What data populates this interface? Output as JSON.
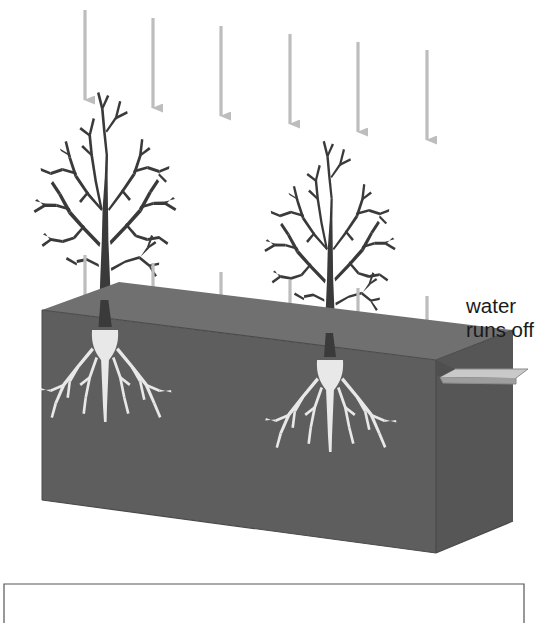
{
  "diagram": {
    "type": "cross-section-illustration",
    "annotations": [
      {
        "id": "water-runs-off",
        "lines": [
          "water",
          "runs off"
        ],
        "x": 466,
        "y": 294,
        "color": "#1a1a1a"
      }
    ],
    "colors": {
      "background": "#ffffff",
      "soil_front": "#5e5e5e",
      "soil_top": "#707070",
      "soil_side": "#565656",
      "soil_edge": "#3f3f3f",
      "tree": "#3a3a3a",
      "root": "#e8e8e8",
      "arrow": "#bdbdbd",
      "spout": "#c9c9c9",
      "spout_edge": "#8a8a8a",
      "frame_border": "#555555"
    },
    "soil_block": {
      "label": "soil-block",
      "top_left": [
        42,
        310
      ],
      "top_right": [
        436,
        360
      ],
      "back_right": [
        513,
        330
      ],
      "front_bottom_left": [
        42,
        500
      ],
      "front_bottom_right": [
        436,
        553
      ],
      "side_bottom_right": [
        513,
        521
      ]
    },
    "spout": {
      "label": "runoff-spout",
      "points": "436,374 447,368 525,368 516,376 462,376 462,385 444,385"
    },
    "rain_arrows_upper": [
      {
        "x": 85,
        "y1": 10,
        "y2": 100
      },
      {
        "x": 153,
        "y1": 18,
        "y2": 108
      },
      {
        "x": 221,
        "y1": 26,
        "y2": 116
      },
      {
        "x": 290,
        "y1": 34,
        "y2": 124
      },
      {
        "x": 358,
        "y1": 42,
        "y2": 132
      },
      {
        "x": 427,
        "y1": 50,
        "y2": 140
      }
    ],
    "rain_arrows_lower": [
      {
        "x": 85,
        "y1": 255,
        "y2": 320
      },
      {
        "x": 153,
        "y1": 263,
        "y2": 330
      },
      {
        "x": 221,
        "y1": 272,
        "y2": 339
      },
      {
        "x": 290,
        "y1": 280,
        "y2": 348
      },
      {
        "x": 358,
        "y1": 288,
        "y2": 357
      },
      {
        "x": 427,
        "y1": 296,
        "y2": 366
      }
    ],
    "trees": [
      {
        "id": "tree-left",
        "trunk_base_x": 105,
        "ground_y": 327,
        "scale": 1.0
      },
      {
        "id": "tree-right",
        "trunk_base_x": 330,
        "ground_y": 357,
        "scale": 0.92
      }
    ],
    "root_systems": [
      {
        "id": "root-left",
        "origin_x": 105,
        "origin_y": 330
      },
      {
        "id": "root-right",
        "origin_x": 330,
        "origin_y": 360
      }
    ],
    "bottom_frame": {
      "label": "caption-frame",
      "x": 4,
      "y": 583,
      "width": 520,
      "height": 40
    }
  }
}
